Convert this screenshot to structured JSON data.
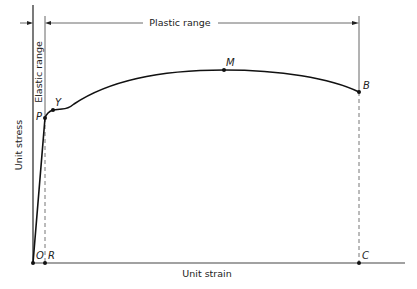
{
  "diagram": {
    "type": "stress-strain curve",
    "axes": {
      "x_label": "Unit strain",
      "y_label": "Unit stress"
    },
    "ranges": {
      "elastic": "Elastic range",
      "plastic": "Plastic range"
    },
    "points": {
      "O": "O",
      "R": "R",
      "P": "P",
      "Y": "Y",
      "M": "M",
      "B": "B",
      "C": "C"
    },
    "colors": {
      "line": "#1a1a1a",
      "guide": "#555555"
    }
  }
}
